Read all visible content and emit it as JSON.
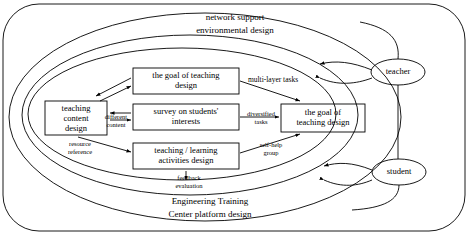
{
  "diagram": {
    "title_top_line1": "network support",
    "title_top_line2": "environmental design",
    "title_bottom_line1": "Engineering Training",
    "title_bottom_line2": "Center platform design",
    "boxes": [
      {
        "id": "teaching-content-design",
        "lines": [
          "teaching",
          "content",
          "design"
        ]
      },
      {
        "id": "goal-of-teaching-design-left",
        "lines": [
          "the goal of teaching",
          "design"
        ]
      },
      {
        "id": "survey-on-students-interests",
        "lines": [
          "survey on students'",
          "interests"
        ]
      },
      {
        "id": "goal-of-teaching-design-right",
        "lines": [
          "the goal of",
          "teaching design"
        ]
      },
      {
        "id": "teaching-learning-activities-design",
        "lines": [
          "teaching / learning",
          "activities design"
        ]
      },
      {
        "id": "teacher",
        "lines": [
          "teacher"
        ]
      },
      {
        "id": "student",
        "lines": [
          "student"
        ]
      }
    ],
    "edge_labels": [
      {
        "id": "multi-layer-tasks",
        "text": "multi-layer tasks"
      },
      {
        "id": "different-content",
        "lines": [
          "different",
          "content"
        ]
      },
      {
        "id": "diversified-tasks",
        "lines": [
          "diversified",
          "tasks"
        ]
      },
      {
        "id": "resource-reference",
        "lines": [
          "resource",
          "reference"
        ]
      },
      {
        "id": "self-help-group",
        "lines": [
          "self-help",
          "group"
        ]
      },
      {
        "id": "feedback-evaluation",
        "lines": [
          "feedback",
          "evaluation"
        ]
      }
    ],
    "colors": {
      "stroke": "#000000",
      "background": "#ffffff"
    }
  }
}
